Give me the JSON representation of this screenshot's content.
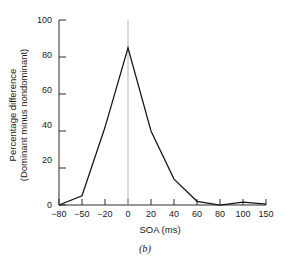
{
  "figure": {
    "caption": "(b)",
    "background_color": "#ffffff",
    "line_color": "#141414",
    "axis_color": "#2b2b2b",
    "reference_line_color": "#b3b3b3"
  },
  "chart_data": {
    "type": "line",
    "title": "",
    "xlabel": "SOA (ms)",
    "ylabel": "Percentage difference (Dominant minus nondominant)",
    "ylabel_line1": "Percentage difference",
    "ylabel_line2": "(Dominant minus nondominant)",
    "x_tick_labels": [
      "−80",
      "−50",
      "−20",
      "0",
      "20",
      "40",
      "60",
      "80",
      "100",
      "150"
    ],
    "x_values": [
      -80,
      -50,
      -20,
      0,
      20,
      40,
      60,
      80,
      100,
      150
    ],
    "x_scale": "ordinal",
    "y_tick_labels": [
      "0",
      "20",
      "40",
      "60",
      "80",
      "100"
    ],
    "y_ticks": [
      0,
      20,
      40,
      60,
      80,
      100
    ],
    "ylim": [
      0,
      100
    ],
    "grid": false,
    "legend": null,
    "annotations": [
      {
        "type": "vertical-reference-line",
        "x": 0,
        "color": "#b3b3b3"
      }
    ],
    "series": [
      {
        "name": "Percentage difference",
        "values": [
          0,
          5,
          42,
          85,
          40,
          14,
          2,
          0,
          1.5,
          0.5
        ]
      }
    ]
  }
}
